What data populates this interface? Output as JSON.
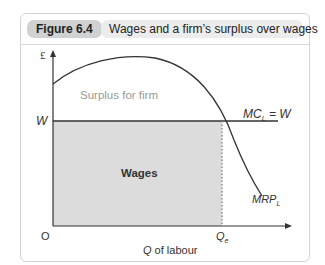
{
  "figure": {
    "label": "Figure 6.4",
    "title": "Wages and a firm’s surplus over wages"
  },
  "diagram": {
    "y_axis_label": "£",
    "x_axis_label_italic": "Q",
    "x_axis_label_rest": " of labour",
    "origin_label": "O",
    "wage_label": "W",
    "mc_label_main": "MC",
    "mc_label_sub": "L",
    "mc_label_tail": " = W",
    "mrp_label_main": "MRP",
    "mrp_label_sub": "L",
    "qe_label_main": "Q",
    "qe_label_sub": "e",
    "surplus_region_label": "Surplus for firm",
    "wages_region_label": "Wages",
    "colors": {
      "wages_fill": "#dcdcdc",
      "curve": "#333333",
      "axis": "#333333",
      "surplus_text": "#999999"
    }
  }
}
